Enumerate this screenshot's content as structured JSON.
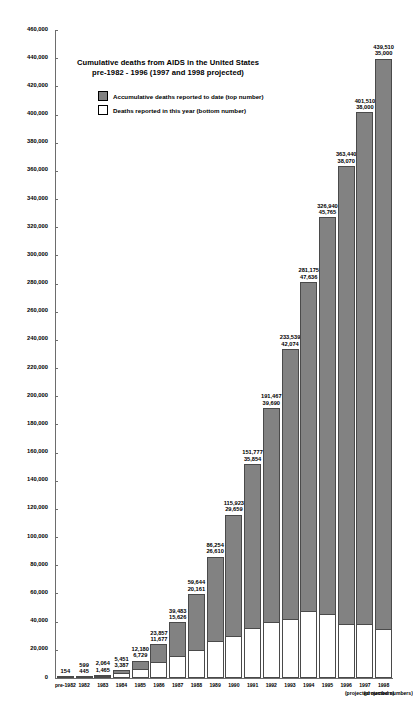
{
  "chart_data": {
    "type": "bar",
    "title": "Cumulative deaths from AIDS in the United States",
    "subtitle": "pre-1982 - 1996 (1997 and 1998 projected)",
    "xlabel": "",
    "ylabel": "",
    "ylim": [
      0,
      460000
    ],
    "ytick_step": 20000,
    "grid": false,
    "legend_position": "inside-top-center",
    "stacked": true,
    "legend": [
      {
        "key": "cumulative",
        "label": "Accumulative deaths reported to date (top number)",
        "swatch": "filled",
        "color": "#828282"
      },
      {
        "key": "annual",
        "label": "Deaths reported in this year (bottom number)",
        "swatch": "empty",
        "color": "#ffffff"
      }
    ],
    "yticks": [
      "460,000",
      "440,000",
      "420,000",
      "400,000",
      "380,000",
      "360,000",
      "340,000",
      "320,000",
      "300,000",
      "280,000",
      "260,000",
      "240,000",
      "220,000",
      "200,000",
      "180,000",
      "160,000",
      "140,000",
      "120,000",
      "100,000",
      "80,000",
      "60,000",
      "40,000",
      "20,000",
      "0"
    ],
    "ytick_values": [
      460000,
      440000,
      420000,
      400000,
      380000,
      360000,
      340000,
      320000,
      300000,
      280000,
      260000,
      240000,
      220000,
      200000,
      180000,
      160000,
      140000,
      120000,
      100000,
      80000,
      60000,
      40000,
      20000,
      0
    ],
    "categories": [
      "pre-1982",
      "1982",
      "1983",
      "1984",
      "1985",
      "1986",
      "1987",
      "1988",
      "1989",
      "1990",
      "1991",
      "1992",
      "1993",
      "1994",
      "1995",
      "1996",
      "1997",
      "1998"
    ],
    "category_notes": [
      "",
      "",
      "",
      "",
      "",
      "",
      "",
      "",
      "",
      "",
      "",
      "",
      "",
      "",
      "",
      "",
      "(projected numbers)",
      "(projected numbers)"
    ],
    "series": [
      {
        "name": "Accumulative deaths reported to date (top number)",
        "key": "cumulative",
        "values": [
          154,
          599,
          2064,
          5451,
          12180,
          23857,
          39483,
          59644,
          86254,
          115923,
          151777,
          191467,
          233539,
          281175,
          326940,
          363440,
          401510,
          439510
        ],
        "labels": [
          "154",
          "599",
          "2,064",
          "5,451",
          "12,180",
          "23,857",
          "39,483",
          "59,644",
          "86,254",
          "115,923",
          "151,777",
          "191,467",
          "233,539",
          "281,175",
          "326,940",
          "363,440",
          "401,510",
          "439,510"
        ]
      },
      {
        "name": "Deaths reported in this year (bottom number)",
        "key": "annual",
        "values": [
          0,
          445,
          1465,
          3387,
          6729,
          11677,
          15626,
          20161,
          26610,
          29659,
          35854,
          39690,
          42074,
          47636,
          45765,
          38070,
          38000,
          35000
        ],
        "labels": [
          "",
          "445",
          "1,465",
          "3,387",
          "6,729",
          "11,677",
          "15,626",
          "20,161",
          "26,610",
          "29,659",
          "35,854",
          "39,690",
          "42,074",
          "47,636",
          "45,765",
          "38,070",
          "38,000",
          "35,000"
        ]
      }
    ]
  }
}
